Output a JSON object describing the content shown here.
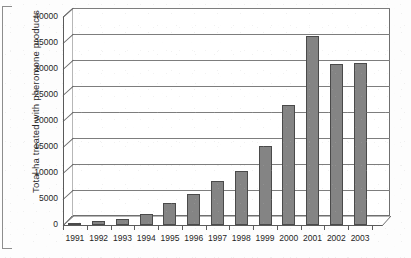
{
  "chart_data": {
    "type": "bar",
    "title": "",
    "subtitle": "",
    "xlabel": "",
    "ylabel": "Total ha treated with pheromone products",
    "categories": [
      "1991",
      "1992",
      "1993",
      "1994",
      "1995",
      "1996",
      "1997",
      "1998",
      "1999",
      "2000",
      "2001",
      "2002",
      "2003"
    ],
    "values": [
      300,
      700,
      1100,
      2200,
      4200,
      6000,
      8400,
      10400,
      15200,
      23000,
      36400,
      31000,
      31100
    ],
    "ylim": [
      0,
      40000
    ],
    "ytick_values": [
      0,
      5000,
      10000,
      15000,
      20000,
      25000,
      30000,
      35000,
      40000
    ],
    "ytick_labels": [
      "0",
      "5000",
      "10000",
      "15000",
      "20000",
      "25000",
      "30000",
      "35000",
      "40000"
    ],
    "grid": true,
    "grid_axis": "y",
    "legend": false,
    "legend_position": "none",
    "style": "3d-column",
    "series": [
      {
        "name": "Total ha treated with pheromone products",
        "values": [
          300,
          700,
          1100,
          2200,
          4200,
          6000,
          8400,
          10400,
          15200,
          23000,
          36400,
          31000,
          31100
        ]
      }
    ]
  },
  "colors": {
    "bar_front": "#848484",
    "bar_side": "#5e5e5e",
    "bar_top": "#9c9c9c",
    "bar_outline": "#4a4a4a",
    "gridline": "#7d7d7d",
    "axis": "#5a5a5a",
    "plot_background": "#ffffff",
    "page_background": "#fdfdfd",
    "text": "#1f1f1f"
  }
}
